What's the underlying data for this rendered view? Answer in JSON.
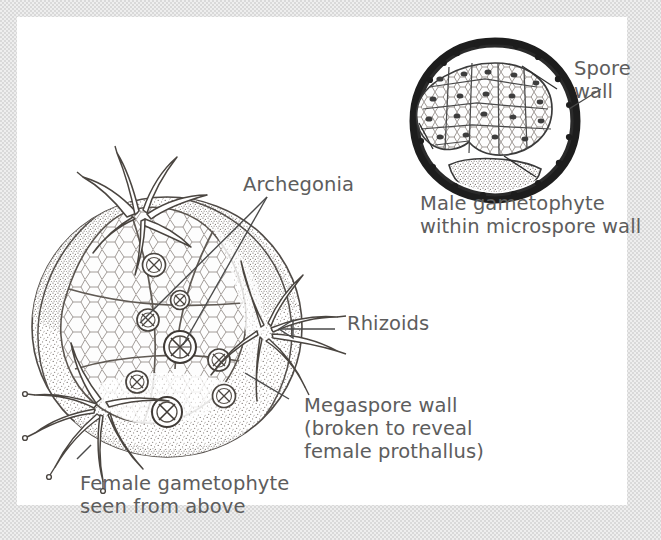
{
  "figure": {
    "kind": "botanical-illustration",
    "panel_background": "#ffffff",
    "border_color": "#d9d9d9",
    "ink_color": "#4a4a4a",
    "text_color": "#5d5d5d"
  },
  "labels": {
    "spore_wall": "Spore\nwall",
    "male_gametophyte": "Male gametophyte\nwithin microspore wall",
    "archegonia": "Archegonia",
    "rhizoids": "Rhizoids",
    "megaspore_wall": "Megaspore wall\n(broken to reveal\nfemale prothallus)",
    "female_gametophyte": "Female gametophyte\nseen from above"
  },
  "structures": {
    "male": {
      "name": "male-gametophyte",
      "wall_label": "spore wall",
      "wall_style": "thick irregular dark rind",
      "contents": "cellular prothallus mass with nuclei",
      "basal_mass": "stippled basal cell mass"
    },
    "female": {
      "name": "female-gametophyte",
      "wall_label": "megaspore wall",
      "wall_state": "broken to reveal female prothallus",
      "archegonia_count": 8,
      "rhizoid_tufts": 3,
      "surface": "stippled megaspore wall with cellular prothallus"
    }
  }
}
